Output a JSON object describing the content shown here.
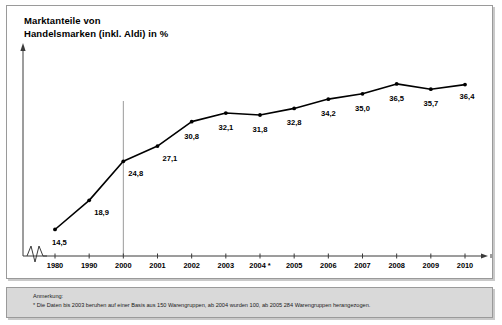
{
  "chart_panel": {
    "title": "Marktanteile von\nHandelsmarken (inkl. Aldi) in %"
  },
  "footnote": {
    "label": "Anmerkung:",
    "text": "* Die Daten bis 2003 beruhen auf einer Basis aus 150 Warengruppen, ab 2004 wurden 100, ab 2005 284 Warengruppen herangezogen."
  },
  "colors": {
    "line": "#000000",
    "panel_border": "#9a9a9a",
    "footnote_background": "#d9d9d9",
    "reference_line": "#9a9a9a",
    "axis": "#3a3a3a"
  },
  "chart_data": {
    "type": "line",
    "title": "Marktanteile von Handelsmarken (inkl. Aldi) in %",
    "xlabel": "",
    "ylabel": "%",
    "categories": [
      "1980",
      "1990",
      "2000",
      "2001",
      "2002",
      "2003",
      "2004 *",
      "2005",
      "2006",
      "2007",
      "2008",
      "2009",
      "2010"
    ],
    "values": [
      14.5,
      18.9,
      24.8,
      27.1,
      30.8,
      32.1,
      31.8,
      32.8,
      34.2,
      35.0,
      36.5,
      35.7,
      36.4
    ],
    "value_labels": [
      "14,5",
      "18,9",
      "24,8",
      "27,1",
      "30,8",
      "32,1",
      "31,8",
      "32,8",
      "34,2",
      "35,0",
      "36,5",
      "35,7",
      "36,4"
    ],
    "ylim": [
      12,
      38
    ],
    "grid": false,
    "legend": null,
    "markers": true,
    "axis_break": true,
    "reference_line_at": "2000",
    "annotations": [
      "* Die Daten bis 2003 beruhen auf einer Basis aus 150 Warengruppen, ab 2004 wurden 100, ab 2005 284 Warengruppen herangezogen."
    ]
  }
}
